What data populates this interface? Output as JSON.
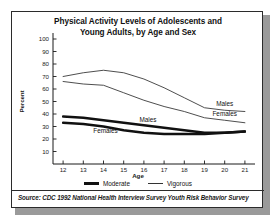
{
  "figure": {
    "title_line1": "Physical Activity Levels of Adolescents and",
    "title_line2": "Young Adults, by Age and Sex",
    "source": "Source: CDC 1992 National Health Interview Survey Youth Risk Behavior Survey"
  },
  "legend": {
    "position": "bottom",
    "items": [
      {
        "label": "Moderate",
        "style": "thick-line",
        "color": "#111111"
      },
      {
        "label": "Vigorous",
        "style": "thin-line",
        "color": "#333333"
      }
    ]
  },
  "inline_labels": {
    "vigorous_males": "Males",
    "vigorous_females": "Females",
    "moderate_males": "Males",
    "moderate_females": "Females"
  },
  "chart_data": {
    "type": "line",
    "title": "Physical Activity Levels of Adolescents and Young Adults, by Age and Sex",
    "xlabel": "Age",
    "ylabel": "Percent",
    "x": [
      12,
      13,
      14,
      15,
      16,
      17,
      18,
      19,
      20,
      21
    ],
    "xlim": [
      11.5,
      21.5
    ],
    "ylim": [
      0,
      100
    ],
    "yticks": [
      10,
      20,
      30,
      40,
      50,
      60,
      70,
      80,
      90,
      100
    ],
    "xticks": [
      12,
      13,
      14,
      15,
      16,
      17,
      18,
      19,
      20,
      21
    ],
    "grid": false,
    "series": [
      {
        "name": "Vigorous, Males",
        "activity": "Vigorous",
        "sex": "Males",
        "style": "thin-line",
        "values": [
          70,
          73,
          75,
          73,
          68,
          61,
          53,
          45,
          43,
          42
        ]
      },
      {
        "name": "Vigorous, Females",
        "activity": "Vigorous",
        "sex": "Females",
        "style": "thin-line",
        "values": [
          66,
          64,
          63,
          57,
          51,
          46,
          42,
          37,
          35,
          33
        ]
      },
      {
        "name": "Moderate, Males",
        "activity": "Moderate",
        "sex": "Males",
        "style": "thick-line",
        "values": [
          38,
          37,
          35,
          33,
          31,
          29,
          27,
          25,
          25,
          26
        ]
      },
      {
        "name": "Moderate, Females",
        "activity": "Moderate",
        "sex": "Females",
        "style": "thick-line",
        "values": [
          33,
          32,
          30,
          27,
          25,
          24,
          24,
          24,
          25,
          26
        ]
      }
    ]
  }
}
